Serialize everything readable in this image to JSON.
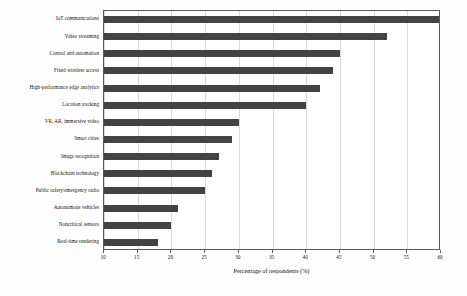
{
  "chart_data": {
    "type": "bar",
    "orientation": "horizontal",
    "title": "",
    "xlabel": "Percentage of respondents (%)",
    "ylabel": "",
    "xlim": [
      10,
      60
    ],
    "xticks": [
      10,
      15,
      20,
      25,
      30,
      35,
      40,
      45,
      50,
      55,
      60
    ],
    "grid": true,
    "legend": null,
    "bar_color": "#434343",
    "categories": [
      "IoT communications",
      "Video streaming",
      "Control and automation",
      "Fixed wireless access",
      "High-performance edge analytics",
      "Location tracking",
      "VR, AR, immersive video",
      "Smart cities",
      "Image recognition",
      "Blockchain technology",
      "Public safety/emergency radio",
      "Autonomous vehicles",
      "Noncritical sensors",
      "Real-time rendering"
    ],
    "values": [
      60,
      52,
      45,
      44,
      42,
      40,
      30,
      29,
      27,
      26,
      25,
      21,
      20,
      18
    ]
  }
}
